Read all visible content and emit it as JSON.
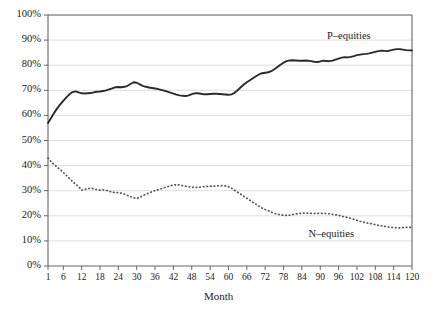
{
  "chart_data": {
    "type": "line",
    "title": "",
    "xlabel": "Month",
    "ylabel": "",
    "xlim": [
      1,
      120
    ],
    "ylim": [
      0,
      100
    ],
    "grid": true,
    "legend_position": "inline-annotation",
    "xticks": [
      "1",
      "6",
      "12",
      "18",
      "24",
      "30",
      "36",
      "42",
      "48",
      "54",
      "60",
      "66",
      "72",
      "78",
      "84",
      "90",
      "96",
      "102",
      "108",
      "114",
      "120"
    ],
    "xtick_values": [
      1,
      6,
      12,
      18,
      24,
      30,
      36,
      42,
      48,
      54,
      60,
      66,
      72,
      78,
      84,
      90,
      96,
      102,
      108,
      114,
      120
    ],
    "yticks": [
      "0%",
      "10%",
      "20%",
      "30%",
      "40%",
      "50%",
      "60%",
      "70%",
      "80%",
      "90%",
      "100%"
    ],
    "ytick_values": [
      0,
      10,
      20,
      30,
      40,
      50,
      60,
      70,
      80,
      90,
      100
    ],
    "x": [
      1,
      2,
      3,
      4,
      5,
      6,
      7,
      8,
      9,
      10,
      11,
      12,
      13,
      14,
      15,
      16,
      17,
      18,
      19,
      20,
      21,
      22,
      23,
      24,
      25,
      26,
      27,
      28,
      29,
      30,
      31,
      32,
      33,
      34,
      35,
      36,
      37,
      38,
      39,
      40,
      41,
      42,
      43,
      44,
      45,
      46,
      47,
      48,
      49,
      50,
      51,
      52,
      53,
      54,
      55,
      56,
      57,
      58,
      59,
      60,
      61,
      62,
      63,
      64,
      65,
      66,
      67,
      68,
      69,
      70,
      71,
      72,
      73,
      74,
      75,
      76,
      77,
      78,
      79,
      80,
      81,
      82,
      83,
      84,
      85,
      86,
      87,
      88,
      89,
      90,
      91,
      92,
      93,
      94,
      95,
      96,
      97,
      98,
      99,
      100,
      101,
      102,
      103,
      104,
      105,
      106,
      107,
      108,
      109,
      110,
      111,
      112,
      113,
      114,
      115,
      116,
      117,
      118,
      119,
      120
    ],
    "series": [
      {
        "name": "P-equities",
        "label": "P–equities",
        "style": "solid",
        "color": "#2b2b2b",
        "label_x": 101,
        "label_y": 91,
        "values": [
          57.0,
          59.0,
          61.0,
          62.8,
          64.4,
          65.8,
          67.2,
          68.4,
          69.3,
          69.6,
          69.2,
          68.8,
          68.7,
          68.8,
          68.9,
          69.2,
          69.4,
          69.5,
          69.7,
          70.0,
          70.4,
          70.8,
          71.2,
          71.3,
          71.2,
          71.4,
          71.8,
          72.5,
          73.2,
          73.0,
          72.4,
          71.8,
          71.4,
          71.1,
          70.9,
          70.7,
          70.5,
          70.2,
          69.9,
          69.5,
          69.1,
          68.7,
          68.3,
          68.0,
          67.8,
          67.7,
          68.0,
          68.5,
          68.8,
          68.8,
          68.6,
          68.4,
          68.4,
          68.5,
          68.6,
          68.6,
          68.5,
          68.4,
          68.3,
          68.2,
          68.4,
          69.0,
          70.0,
          71.2,
          72.3,
          73.2,
          74.0,
          74.8,
          75.6,
          76.3,
          76.8,
          77.0,
          77.2,
          77.6,
          78.4,
          79.3,
          80.2,
          81.0,
          81.6,
          81.9,
          82.0,
          81.9,
          81.8,
          81.8,
          81.9,
          81.8,
          81.6,
          81.4,
          81.3,
          81.5,
          81.8,
          81.7,
          81.6,
          81.8,
          82.2,
          82.6,
          83.0,
          83.2,
          83.1,
          83.3,
          83.6,
          84.0,
          84.2,
          84.4,
          84.5,
          84.7,
          85.0,
          85.3,
          85.6,
          85.8,
          85.7,
          85.6,
          85.9,
          86.2,
          86.4,
          86.4,
          86.2,
          86.0,
          85.9,
          85.9
        ]
      },
      {
        "name": "N-equities",
        "label": "N–equities",
        "style": "dotted",
        "color": "#555555",
        "label_x": 95,
        "label_y": 12,
        "values": [
          43.0,
          41.6,
          40.4,
          39.4,
          38.4,
          37.3,
          36.1,
          34.9,
          33.7,
          32.6,
          31.6,
          30.2,
          30.5,
          30.8,
          31.0,
          30.8,
          30.4,
          30.2,
          30.3,
          30.1,
          29.8,
          29.4,
          29.3,
          29.2,
          29.0,
          28.6,
          28.1,
          27.6,
          27.2,
          26.9,
          27.4,
          28.0,
          28.6,
          29.1,
          29.6,
          30.0,
          30.4,
          30.8,
          31.2,
          31.6,
          32.0,
          32.2,
          32.4,
          32.3,
          32.0,
          31.8,
          31.6,
          31.4,
          31.3,
          31.4,
          31.5,
          31.6,
          31.7,
          31.8,
          31.8,
          31.9,
          32.0,
          32.0,
          31.9,
          31.6,
          31.0,
          30.2,
          29.4,
          28.6,
          27.8,
          27.0,
          26.2,
          25.4,
          24.6,
          23.8,
          23.1,
          22.5,
          22.0,
          21.5,
          21.0,
          20.6,
          20.4,
          20.2,
          20.2,
          20.3,
          20.5,
          20.7,
          20.9,
          21.0,
          21.1,
          21.1,
          21.0,
          21.0,
          21.0,
          21.0,
          21.0,
          20.9,
          20.8,
          20.6,
          20.4,
          20.2,
          19.9,
          19.6,
          19.3,
          19.0,
          18.6,
          18.2,
          17.8,
          17.5,
          17.2,
          17.0,
          16.8,
          16.5,
          16.2,
          16.0,
          15.8,
          15.6,
          15.4,
          15.3,
          15.2,
          15.2,
          15.3,
          15.4,
          15.4,
          15.4
        ]
      }
    ]
  },
  "plot": {
    "frame_color": "#666666",
    "grid_color": "#d4d4d4",
    "background": "#ffffff"
  }
}
